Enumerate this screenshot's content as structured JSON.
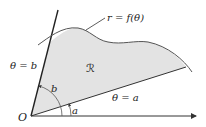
{
  "diagram": {
    "labels": {
      "curve": "r = f(θ)",
      "ray_b": "θ = b",
      "ray_a": "θ = a",
      "region": "ℛ",
      "angle_b": "b",
      "angle_a": "a",
      "origin": "O"
    },
    "colors": {
      "region_fill": "#e3e3e3",
      "stroke": "#333333",
      "curve": "#555555"
    }
  }
}
